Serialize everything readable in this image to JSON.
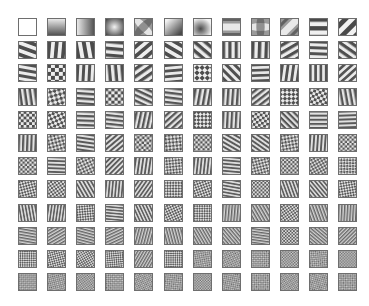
{
  "figure": {
    "grid": {
      "rows": 12,
      "cols": 12,
      "origin_x": 18,
      "origin_y": 18,
      "col_pitch": 29.1,
      "row_pitch": 23.2,
      "cell_w": 19,
      "cell_h": 18
    },
    "colors": {
      "background": "#ffffff",
      "cell_border": "#6e6e6e",
      "light": "#f2f2f2",
      "dark": "#4a4a4a",
      "mid": "#9a9a9a"
    },
    "rows": [
      [
        {
          "type": "blank"
        },
        {
          "type": "gradient",
          "angle": 90
        },
        {
          "type": "gradient",
          "angle": 0
        },
        {
          "type": "blob",
          "cx": 0.5,
          "cy": 0.5,
          "invert": false
        },
        {
          "type": "saddle",
          "angle": 45
        },
        {
          "type": "gradient",
          "angle": 45
        },
        {
          "type": "blob",
          "cx": 0.4,
          "cy": 0.6,
          "invert": true
        },
        {
          "type": "band",
          "angle": 0,
          "freq": 1.2
        },
        {
          "type": "saddle",
          "angle": 0
        },
        {
          "type": "band",
          "angle": 135,
          "freq": 1.4
        },
        {
          "type": "stripes",
          "angle": 90,
          "freq": 2.2
        },
        {
          "type": "stripes",
          "angle": 45,
          "freq": 2.0
        }
      ],
      [
        {
          "type": "stripes",
          "angle": 110,
          "freq": 2.6
        },
        {
          "type": "stripes",
          "angle": 5,
          "freq": 2.6
        },
        {
          "type": "stripes",
          "angle": 170,
          "freq": 2.4
        },
        {
          "type": "stripes",
          "angle": 95,
          "freq": 2.8
        },
        {
          "type": "stripes",
          "angle": 50,
          "freq": 2.6
        },
        {
          "type": "stripes",
          "angle": 120,
          "freq": 2.6
        },
        {
          "type": "stripes",
          "angle": 130,
          "freq": 2.8
        },
        {
          "type": "stripes",
          "angle": 0,
          "freq": 3.0
        },
        {
          "type": "stripes",
          "angle": 2,
          "freq": 2.8
        },
        {
          "type": "stripes",
          "angle": 60,
          "freq": 3.0
        },
        {
          "type": "stripes",
          "angle": 92,
          "freq": 3.2
        },
        {
          "type": "stripes",
          "angle": 125,
          "freq": 3.0
        }
      ],
      [
        {
          "type": "stripes",
          "angle": 100,
          "freq": 3.2
        },
        {
          "type": "checker",
          "angle": 0,
          "freq": 2.4
        },
        {
          "type": "stripes",
          "angle": 3,
          "freq": 3.2
        },
        {
          "type": "stripes",
          "angle": 175,
          "freq": 3.0
        },
        {
          "type": "stripes",
          "angle": 55,
          "freq": 3.0
        },
        {
          "type": "stripes",
          "angle": 85,
          "freq": 3.4
        },
        {
          "type": "checker",
          "angle": 45,
          "freq": 2.6
        },
        {
          "type": "stripes",
          "angle": 135,
          "freq": 3.2
        },
        {
          "type": "stripes",
          "angle": 88,
          "freq": 3.6
        },
        {
          "type": "stripes",
          "angle": 8,
          "freq": 3.4
        },
        {
          "type": "stripes",
          "angle": 0,
          "freq": 3.6
        },
        {
          "type": "stripes",
          "angle": 48,
          "freq": 3.6
        }
      ],
      [
        {
          "type": "stripes",
          "angle": 172,
          "freq": 3.8
        },
        {
          "type": "checker",
          "angle": 30,
          "freq": 3.0
        },
        {
          "type": "stripes",
          "angle": 94,
          "freq": 3.8
        },
        {
          "type": "checker",
          "angle": 0,
          "freq": 3.0
        },
        {
          "type": "stripes",
          "angle": 115,
          "freq": 3.8
        },
        {
          "type": "stripes",
          "angle": 97,
          "freq": 4.0
        },
        {
          "type": "stripes",
          "angle": 10,
          "freq": 3.8
        },
        {
          "type": "stripes",
          "angle": 4,
          "freq": 4.0
        },
        {
          "type": "stripes",
          "angle": 52,
          "freq": 4.0
        },
        {
          "type": "checker",
          "angle": 45,
          "freq": 3.2
        },
        {
          "type": "checker",
          "angle": 15,
          "freq": 3.4
        },
        {
          "type": "stripes",
          "angle": 170,
          "freq": 4.0
        }
      ],
      [
        {
          "type": "checker",
          "angle": 0,
          "freq": 3.4
        },
        {
          "type": "checker",
          "angle": 20,
          "freq": 3.4
        },
        {
          "type": "stripes",
          "angle": 92,
          "freq": 4.2
        },
        {
          "type": "stripes",
          "angle": 96,
          "freq": 4.4
        },
        {
          "type": "stripes",
          "angle": 12,
          "freq": 4.2
        },
        {
          "type": "stripes",
          "angle": 48,
          "freq": 4.2
        },
        {
          "type": "checker",
          "angle": 45,
          "freq": 3.6
        },
        {
          "type": "stripes",
          "angle": 3,
          "freq": 4.4
        },
        {
          "type": "checker",
          "angle": 10,
          "freq": 3.6
        },
        {
          "type": "stripes",
          "angle": 135,
          "freq": 4.4
        },
        {
          "type": "stripes",
          "angle": 90,
          "freq": 4.6
        },
        {
          "type": "stripes",
          "angle": 88,
          "freq": 4.8
        }
      ],
      [
        {
          "type": "stripes",
          "angle": 2,
          "freq": 4.6
        },
        {
          "type": "checker",
          "angle": 30,
          "freq": 3.8
        },
        {
          "type": "stripes",
          "angle": 98,
          "freq": 4.8
        },
        {
          "type": "stripes",
          "angle": 50,
          "freq": 4.8
        },
        {
          "type": "checker",
          "angle": 5,
          "freq": 3.8
        },
        {
          "type": "checker",
          "angle": 40,
          "freq": 3.8
        },
        {
          "type": "checker",
          "angle": 0,
          "freq": 4.0
        },
        {
          "type": "stripes",
          "angle": 120,
          "freq": 4.8
        },
        {
          "type": "stripes",
          "angle": 125,
          "freq": 5.0
        },
        {
          "type": "checker",
          "angle": 35,
          "freq": 4.0
        },
        {
          "type": "stripes",
          "angle": 4,
          "freq": 5.0
        },
        {
          "type": "checker",
          "angle": 0,
          "freq": 4.2
        }
      ],
      [
        {
          "type": "checker",
          "angle": 0,
          "freq": 4.2
        },
        {
          "type": "stripes",
          "angle": 92,
          "freq": 5.2
        },
        {
          "type": "checker",
          "angle": 20,
          "freq": 4.2
        },
        {
          "type": "stripes",
          "angle": 45,
          "freq": 5.2
        },
        {
          "type": "stripes",
          "angle": 8,
          "freq": 5.2
        },
        {
          "type": "checker",
          "angle": 40,
          "freq": 4.4
        },
        {
          "type": "stripes",
          "angle": 6,
          "freq": 5.4
        },
        {
          "type": "stripes",
          "angle": 95,
          "freq": 5.4
        },
        {
          "type": "checker",
          "angle": 30,
          "freq": 4.4
        },
        {
          "type": "checker",
          "angle": 0,
          "freq": 4.6
        },
        {
          "type": "checker",
          "angle": 15,
          "freq": 4.6
        },
        {
          "type": "checker",
          "angle": 45,
          "freq": 4.6
        }
      ],
      [
        {
          "type": "checker",
          "angle": 30,
          "freq": 4.8
        },
        {
          "type": "checker",
          "angle": 10,
          "freq": 4.8
        },
        {
          "type": "stripes",
          "angle": 150,
          "freq": 5.6
        },
        {
          "type": "stripes",
          "angle": 5,
          "freq": 5.8
        },
        {
          "type": "stripes",
          "angle": 35,
          "freq": 5.8
        },
        {
          "type": "checker",
          "angle": 45,
          "freq": 4.8
        },
        {
          "type": "checker",
          "angle": 25,
          "freq": 5.0
        },
        {
          "type": "stripes",
          "angle": 100,
          "freq": 5.8
        },
        {
          "type": "checker",
          "angle": 0,
          "freq": 5.0
        },
        {
          "type": "stripes",
          "angle": 160,
          "freq": 6.0
        },
        {
          "type": "stripes",
          "angle": 140,
          "freq": 6.0
        },
        {
          "type": "checker",
          "angle": 35,
          "freq": 5.0
        }
      ],
      [
        {
          "type": "stripes",
          "angle": 170,
          "freq": 6.0
        },
        {
          "type": "stripes",
          "angle": 8,
          "freq": 6.2
        },
        {
          "type": "checker",
          "angle": 40,
          "freq": 5.2
        },
        {
          "type": "stripes",
          "angle": 95,
          "freq": 6.2
        },
        {
          "type": "stripes",
          "angle": 155,
          "freq": 6.2
        },
        {
          "type": "checker",
          "angle": 20,
          "freq": 5.2
        },
        {
          "type": "checker",
          "angle": 45,
          "freq": 5.4
        },
        {
          "type": "stripes",
          "angle": 5,
          "freq": 6.4
        },
        {
          "type": "stripes",
          "angle": 150,
          "freq": 6.4
        },
        {
          "type": "checker",
          "angle": 10,
          "freq": 5.4
        },
        {
          "type": "stripes",
          "angle": 160,
          "freq": 6.4
        },
        {
          "type": "stripes",
          "angle": 3,
          "freq": 6.6
        }
      ],
      [
        {
          "type": "stripes",
          "angle": 100,
          "freq": 6.6
        },
        {
          "type": "stripes",
          "angle": 60,
          "freq": 6.6
        },
        {
          "type": "stripes",
          "angle": 105,
          "freq": 6.8
        },
        {
          "type": "stripes",
          "angle": 65,
          "freq": 6.8
        },
        {
          "type": "stripes",
          "angle": 15,
          "freq": 6.8
        },
        {
          "type": "stripes",
          "angle": 165,
          "freq": 6.8
        },
        {
          "type": "stripes",
          "angle": 150,
          "freq": 7.0
        },
        {
          "type": "stripes",
          "angle": 140,
          "freq": 7.0
        },
        {
          "type": "stripes",
          "angle": 98,
          "freq": 7.0
        },
        {
          "type": "checker",
          "angle": 0,
          "freq": 5.8
        },
        {
          "type": "stripes",
          "angle": 130,
          "freq": 7.2
        },
        {
          "type": "stripes",
          "angle": 45,
          "freq": 7.2
        }
      ],
      [
        {
          "type": "checker",
          "angle": 45,
          "freq": 6.0
        },
        {
          "type": "checker",
          "angle": 30,
          "freq": 6.0
        },
        {
          "type": "checker",
          "angle": 15,
          "freq": 6.2
        },
        {
          "type": "checker",
          "angle": 40,
          "freq": 6.2
        },
        {
          "type": "stripes",
          "angle": 30,
          "freq": 7.4
        },
        {
          "type": "checker",
          "angle": 45,
          "freq": 6.2
        },
        {
          "type": "checker",
          "angle": 35,
          "freq": 6.4
        },
        {
          "type": "checker",
          "angle": 20,
          "freq": 6.4
        },
        {
          "type": "checker",
          "angle": 45,
          "freq": 6.4
        },
        {
          "type": "checker",
          "angle": 5,
          "freq": 6.6
        },
        {
          "type": "checker",
          "angle": 40,
          "freq": 6.6
        },
        {
          "type": "checker",
          "angle": 0,
          "freq": 6.6
        }
      ],
      [
        {
          "type": "checker",
          "angle": 45,
          "freq": 6.8
        },
        {
          "type": "checker",
          "angle": 30,
          "freq": 6.8
        },
        {
          "type": "checker",
          "angle": 10,
          "freq": 7.0
        },
        {
          "type": "checker",
          "angle": 45,
          "freq": 7.0
        },
        {
          "type": "checker",
          "angle": 20,
          "freq": 7.0
        },
        {
          "type": "checker",
          "angle": 40,
          "freq": 7.2
        },
        {
          "type": "checker",
          "angle": 0,
          "freq": 7.2
        },
        {
          "type": "checker",
          "angle": 35,
          "freq": 7.2
        },
        {
          "type": "checker",
          "angle": 45,
          "freq": 7.4
        },
        {
          "type": "checker",
          "angle": 15,
          "freq": 7.4
        },
        {
          "type": "checker",
          "angle": 30,
          "freq": 7.4
        },
        {
          "type": "checker",
          "angle": 45,
          "freq": 7.6
        }
      ]
    ]
  }
}
